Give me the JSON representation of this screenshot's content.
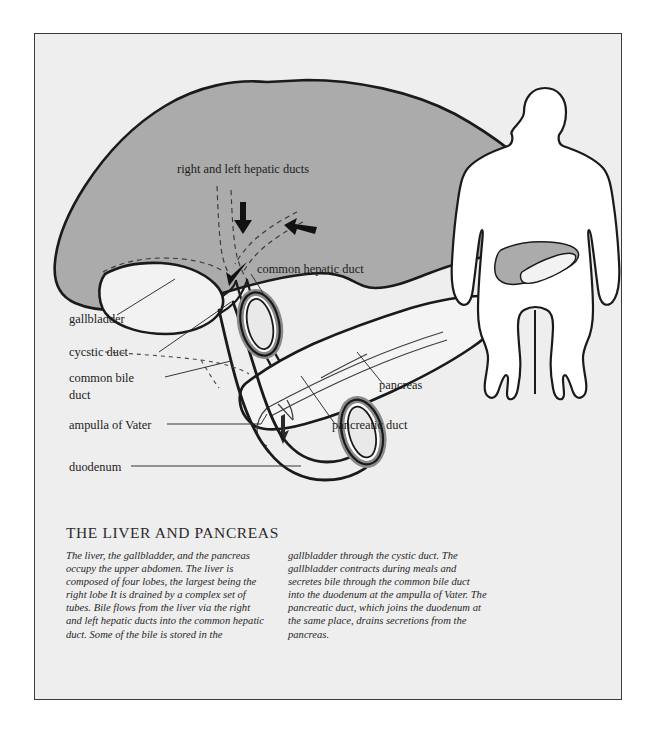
{
  "figure": {
    "title": "THE LIVER AND PANCREAS",
    "background_color": "#eeeeee",
    "page_color": "#ffffff",
    "frame_color": "#3a3a3a",
    "liver_fill": "#ababab",
    "pancreas_fill": "#f4f4f4",
    "outline_color": "#1a1a1a"
  },
  "labels": {
    "hepatic_ducts": "right and left hepatic ducts",
    "common_hepatic_duct": "common hepatic duct",
    "gallbladder": "gallbladder",
    "cystic_duct": "cycstic duct",
    "common_bile_duct_line1": "common bile",
    "common_bile_duct_line2": "duct",
    "ampulla": "ampulla of Vater",
    "duodenum": "duodenum",
    "pancreas": "pancreas",
    "pancreatic_duct": "pancreatic duct"
  },
  "caption": {
    "column_left": "The liver, the gallbladder, and the pancreas occupy the upper abdomen. The liver is composed of four lobes, the largest being the right lobe It is drained by a complex set of tubes. Bile flows from the liver via the right and left hepatic ducts into the common hepatic duct. Some of the bile is stored in the",
    "column_right": "gallbladder through the cystic duct. The gallbladder contracts during meals and secretes bile through the common bile duct into the duodenum at the ampulla of Vater. The pancreatic duct, which joins the duodenum at the same place, drains secretions from the pancreas."
  }
}
